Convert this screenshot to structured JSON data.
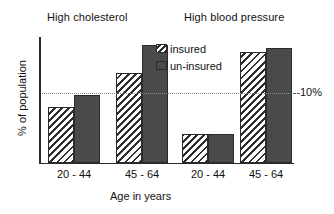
{
  "chart_data": {
    "type": "bar",
    "title": "",
    "xlabel": "Age in years",
    "ylabel": "% of population",
    "grid": false,
    "legend_position": "inside-top-center",
    "ylim": [
      0,
      18
    ],
    "group_titles": [
      "High cholesterol",
      "High blood pressure"
    ],
    "categories": [
      "20 - 44",
      "45 - 64",
      "20 - 44",
      "45 - 64"
    ],
    "series": [
      {
        "name": "insured",
        "values": [
          8.0,
          12.9,
          4.1,
          15.9
        ]
      },
      {
        "name": "un-insured",
        "values": [
          9.7,
          16.9,
          4.1,
          16.4
        ]
      }
    ],
    "annotations": [
      {
        "name": "reference-line-label",
        "text": "10%",
        "value": 10
      }
    ],
    "colors": {
      "insured_fill": "#ffffff",
      "insured_hatch": "#2e2e2e",
      "uninsured_fill": "#4a4a4a",
      "axis": "#2a2a2a",
      "reference_line": "#8a8a8a",
      "text": "#111111"
    }
  }
}
